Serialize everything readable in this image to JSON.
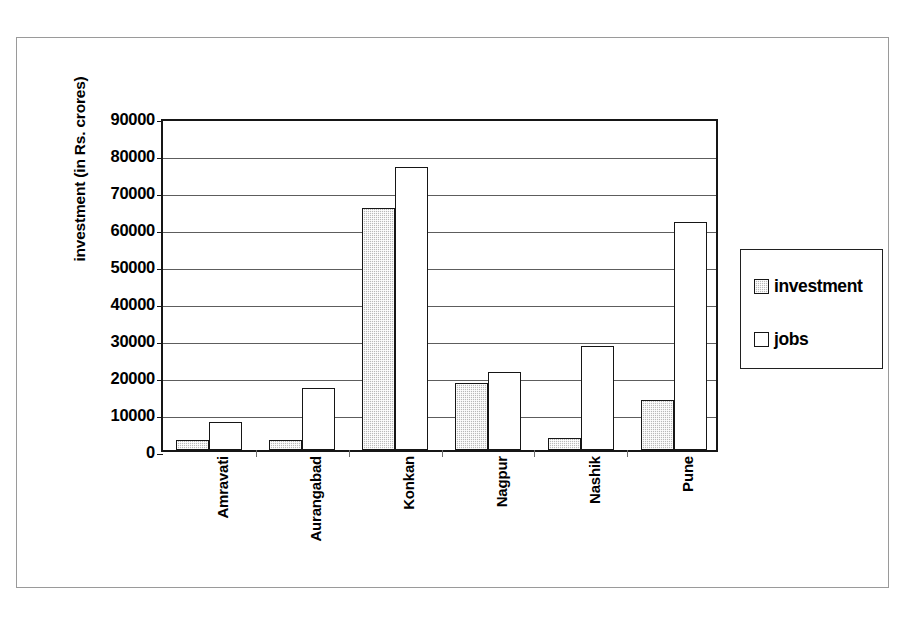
{
  "chart_data": {
    "type": "bar",
    "title": "",
    "xlabel": "",
    "ylabel": "investment (in Rs. crores)",
    "categories": [
      "Amravati",
      "Aurangabad",
      "Konkan",
      "Nagpur",
      "Nashik",
      "Pune"
    ],
    "series": [
      {
        "name": "investment",
        "values": [
          2800,
          2600,
          65500,
          18000,
          3200,
          13500
        ],
        "color": "#b9b9b9",
        "pattern": "dotted-fill"
      },
      {
        "name": "jobs",
        "values": [
          7500,
          16800,
          76500,
          21000,
          28000,
          61500
        ],
        "color": "#ffffff",
        "pattern": "solid-white"
      }
    ],
    "ylim": [
      0,
      90000
    ],
    "ytick_step": 10000,
    "yticks": [
      0,
      10000,
      20000,
      30000,
      40000,
      50000,
      60000,
      70000,
      80000,
      90000
    ],
    "ytick_labels": [
      "0",
      "10000",
      "20000",
      "30000",
      "40000",
      "50000",
      "60000",
      "70000",
      "80000",
      "90000"
    ],
    "grid": true,
    "grid_axis": "y",
    "legend": [
      "investment",
      "jobs"
    ],
    "legend_position": "right",
    "xtick_label_rotation": 90,
    "plot_background": "#ffffff",
    "axis_color": "#161616"
  },
  "legend": {
    "entries": [
      {
        "label": "investment",
        "swatch": "investment-swatch"
      },
      {
        "label": "jobs",
        "swatch": "jobs-swatch"
      }
    ]
  },
  "axes": {
    "y_title": "investment (in Rs. crores)"
  }
}
